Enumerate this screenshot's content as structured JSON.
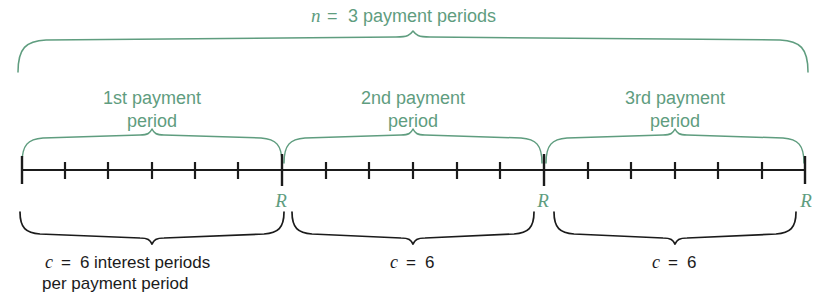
{
  "figure": {
    "title_top": {
      "variable": "n",
      "equals": "=",
      "text": "3 payment periods",
      "full": "n = 3 payment periods"
    },
    "color_green": "#5f9d7f",
    "color_black": "#1b1b1b",
    "background": "#ffffff",
    "periods": [
      {
        "label_line1": "1st payment",
        "label_line2": "period",
        "payment_marker": "R",
        "bottom_label_var": "c",
        "bottom_label_equals": "=",
        "bottom_label_value": "6",
        "bottom_label_line1": "c = 6 interest periods",
        "bottom_label_line2": "per payment period",
        "interest_periods": 6
      },
      {
        "label_line1": "2nd payment",
        "label_line2": "period",
        "payment_marker": "R",
        "bottom_label_var": "c",
        "bottom_label_equals": "=",
        "bottom_label_value": "6",
        "bottom_label_line1": "c = 6",
        "bottom_label_line2": "",
        "interest_periods": 6
      },
      {
        "label_line1": "3rd payment",
        "label_line2": "period",
        "payment_marker": "R",
        "bottom_label_var": "c",
        "bottom_label_equals": "=",
        "bottom_label_value": "6",
        "bottom_label_line1": "c = 6",
        "bottom_label_line2": "",
        "interest_periods": 6
      }
    ],
    "timeline": {
      "total_interest_periods": 18,
      "boundaries_px": [
        22,
        282,
        544,
        805
      ],
      "major_tick_count": 4,
      "minor_ticks_per_period": 5
    }
  }
}
